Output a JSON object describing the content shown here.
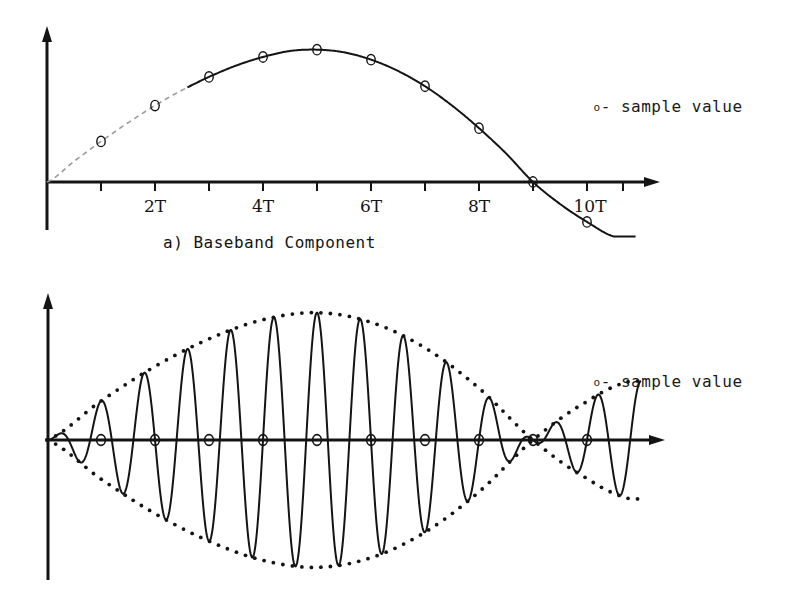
{
  "figure": {
    "background_color": "#ffffff",
    "ink_color": "#141414",
    "faint_ink_color": "#8a8a8a"
  },
  "panel_a": {
    "caption": "a) Baseband Component",
    "legend": {
      "marker_glyph": "o",
      "text": "- sample value"
    },
    "axis": {
      "tick_labels": [
        "2T",
        "4T",
        "6T",
        "8T",
        "10T"
      ],
      "tick_label_positions_T": [
        2,
        4,
        6,
        8,
        10
      ],
      "ticks_T": [
        1,
        2,
        3,
        4,
        5,
        6,
        7,
        8,
        9,
        10,
        11
      ],
      "x_arrow": true,
      "y_arrow": true
    },
    "chart_data": {
      "type": "line",
      "title": "a) Baseband Component",
      "xlabel": "",
      "ylabel": "",
      "grid": false,
      "legend_position": "right",
      "xlim": [
        0,
        11.5
      ],
      "ylim": [
        -0.35,
        1.15
      ],
      "annotations": [
        "o - sample value"
      ],
      "series": [
        {
          "name": "baseband pulse",
          "comment": "raised-cosine-like pulse, zero at t=0, peak near 4.5T, zero crossing at 9T",
          "x": [
            0,
            0.5,
            1,
            1.5,
            2,
            2.5,
            3,
            3.5,
            4,
            4.5,
            5,
            5.5,
            6,
            6.5,
            7,
            7.5,
            8,
            8.5,
            9,
            9.5,
            10,
            10.5
          ],
          "y": [
            0.0,
            0.155,
            0.305,
            0.445,
            0.575,
            0.69,
            0.79,
            0.875,
            0.94,
            0.985,
            0.995,
            0.975,
            0.92,
            0.835,
            0.72,
            0.575,
            0.405,
            0.215,
            0.0,
            -0.165,
            -0.3,
            -0.41
          ]
        }
      ],
      "sample_points": {
        "name": "sample value",
        "marker": "o",
        "x": [
          1,
          2,
          3,
          4,
          5,
          6,
          7,
          8,
          9,
          10
        ],
        "y": [
          0.305,
          0.575,
          0.79,
          0.94,
          0.995,
          0.92,
          0.72,
          0.405,
          0.0,
          -0.3
        ]
      }
    }
  },
  "panel_b": {
    "legend": {
      "marker_glyph": "o",
      "text": "- sample value"
    },
    "axis": {
      "x_arrow": true,
      "y_arrow": true
    },
    "chart_data": {
      "type": "line",
      "title": "",
      "xlabel": "",
      "ylabel": "",
      "grid": false,
      "legend_position": "right",
      "xlim": [
        0,
        11.5
      ],
      "ylim": [
        -1.15,
        1.15
      ],
      "annotations": [
        "o - sample value"
      ],
      "series": [
        {
          "name": "modulated carrier",
          "comment": "baseband envelope multiplied by a carrier; zero crossings fall exactly on every sample instant nT"
        },
        {
          "name": "upper envelope (dotted)",
          "comment": "positive baseband pulse magnitude, dotted",
          "x": [
            0,
            1,
            2,
            3,
            4,
            5,
            6,
            7,
            8,
            9,
            10,
            10.8
          ],
          "y": [
            0.0,
            0.305,
            0.575,
            0.79,
            0.94,
            0.995,
            0.92,
            0.72,
            0.405,
            0.0,
            -0.3,
            -0.46
          ]
        },
        {
          "name": "lower envelope (dotted)",
          "comment": "negative mirror of the baseband pulse, dotted",
          "x": [
            0,
            1,
            2,
            3,
            4,
            5,
            6,
            7,
            8,
            9,
            10,
            10.8
          ],
          "y": [
            0.0,
            -0.305,
            -0.575,
            -0.79,
            -0.94,
            -0.995,
            -0.92,
            -0.72,
            -0.405,
            0.0,
            0.3,
            0.46
          ]
        }
      ],
      "sample_points": {
        "name": "sample value",
        "marker": "o",
        "comment": "all samples of the modulated carrier are zero",
        "x": [
          1,
          2,
          3,
          4,
          5,
          6,
          7,
          8,
          9,
          10
        ],
        "y": [
          0,
          0,
          0,
          0,
          0,
          0,
          0,
          0,
          0,
          0
        ]
      }
    }
  }
}
